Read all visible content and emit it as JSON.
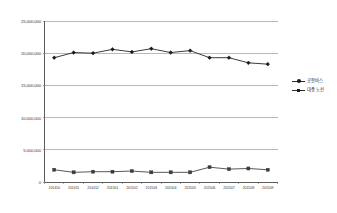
{
  "chart_data": {
    "type": "line",
    "title": "",
    "subtitle": "",
    "xlabel": "",
    "ylabel": "",
    "ylim": [
      0,
      25000000
    ],
    "ytick_labels": [
      "25,000,000",
      "20,000,000",
      "15,000,000",
      "10,000,000",
      "5,000,000",
      "0"
    ],
    "ytick_values": [
      25000000,
      20000000,
      15000000,
      10000000,
      5000000,
      0
    ],
    "grid": "horizontal",
    "legend_position": "right",
    "categories": [
      "201410",
      "201411",
      "201412",
      "201501",
      "201502",
      "201503",
      "201504",
      "201505",
      "201506",
      "201507",
      "201508",
      "201509"
    ],
    "series": [
      {
        "name": "공항버스",
        "color": "#1a1a1a",
        "marker": "diamond",
        "values": [
          19300000,
          20100000,
          20000000,
          20600000,
          20200000,
          20700000,
          20100000,
          20400000,
          19300000,
          19300000,
          18500000,
          18300000
        ]
      },
      {
        "name": "대중 노선",
        "color": "#3a3a3a",
        "marker": "square",
        "values": [
          1900000,
          1500000,
          1600000,
          1600000,
          1700000,
          1500000,
          1500000,
          1500000,
          2300000,
          2000000,
          2100000,
          1900000
        ]
      }
    ]
  },
  "legend": {
    "items": [
      {
        "label": "공항버스",
        "marker": "diamond"
      },
      {
        "label": "대중 노선",
        "marker": "square"
      }
    ]
  }
}
